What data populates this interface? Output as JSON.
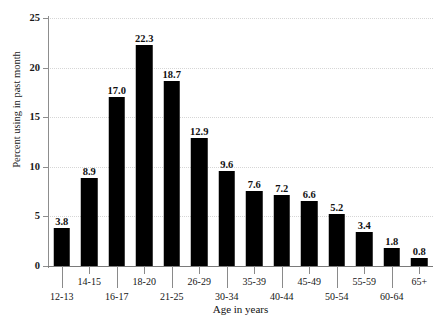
{
  "chart_data": {
    "type": "bar",
    "title": "",
    "xlabel": "Age in years",
    "ylabel": "Percent using in past month",
    "categories": [
      "12-13",
      "14-15",
      "16-17",
      "18-20",
      "21-25",
      "26-29",
      "30-34",
      "35-39",
      "40-44",
      "45-49",
      "50-54",
      "55-59",
      "60-64",
      "65+"
    ],
    "values": [
      3.8,
      8.9,
      17.0,
      22.3,
      18.7,
      12.9,
      9.6,
      7.6,
      7.2,
      6.6,
      5.2,
      3.4,
      1.8,
      0.8
    ],
    "value_labels": [
      "3.8",
      "8.9",
      "17.0",
      "22.3",
      "18.7",
      "12.9",
      "9.6",
      "7.6",
      "7.2",
      "6.6",
      "5.2",
      "3.4",
      "1.8",
      "0.8"
    ],
    "ylim": [
      0,
      25
    ],
    "yticks": [
      0,
      5,
      10,
      15,
      20,
      25
    ],
    "ytick_labels": [
      "0",
      "5",
      "10",
      "15",
      "20",
      "25"
    ],
    "grid": "horizontal-dotted",
    "legend": "none",
    "bar_color": "#000000",
    "grid_color": "#d6d6d6",
    "axis_color": "#8a8a8a"
  },
  "clipped_title": "",
  "axis": {
    "x_title": "Age in years",
    "y_title": "Percent using in past month"
  }
}
